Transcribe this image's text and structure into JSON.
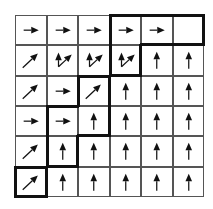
{
  "diagram": {
    "type": "dynamic-programming-traceback-grid",
    "rows": 6,
    "cols": 6,
    "cells": [
      [
        "right",
        "right",
        "right",
        "right",
        "right",
        "none"
      ],
      [
        "diag",
        "up+diag",
        "up+diag",
        "up+diag",
        "up",
        "up"
      ],
      [
        "diag",
        "right",
        "diag",
        "up",
        "up",
        "up"
      ],
      [
        "right",
        "right",
        "up",
        "up",
        "up",
        "up"
      ],
      [
        "diag",
        "up",
        "up",
        "up",
        "up",
        "up"
      ],
      [
        "diag",
        "up",
        "up",
        "up",
        "up",
        "up"
      ]
    ],
    "highlighted_path": [
      [
        5,
        0
      ],
      [
        4,
        1
      ],
      [
        3,
        1
      ],
      [
        3,
        2
      ],
      [
        2,
        2
      ],
      [
        1,
        3
      ],
      [
        0,
        3
      ],
      [
        0,
        4
      ],
      [
        0,
        5
      ]
    ],
    "colors": {
      "arrow": "#111111",
      "grid": "#555555",
      "path_border": "#111111"
    }
  }
}
